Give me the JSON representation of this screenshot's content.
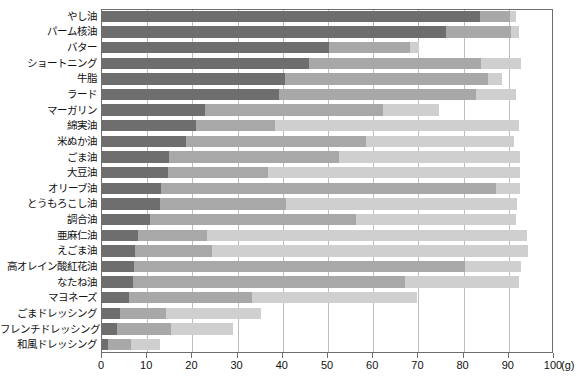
{
  "chart_data": {
    "type": "bar",
    "orientation": "horizontal",
    "stacked": true,
    "title": "",
    "subtitle": "",
    "xlabel": "",
    "ylabel": "",
    "unit_label": "(g)",
    "xlim": [
      0,
      100
    ],
    "xticks": [
      0,
      10,
      20,
      30,
      40,
      50,
      60,
      70,
      80,
      90,
      100
    ],
    "xticklabels": [
      "0",
      "10",
      "20",
      "30",
      "40",
      "50",
      "60",
      "70",
      "80",
      "90",
      "100"
    ],
    "grid": "vertical",
    "legend": "none",
    "categories": [
      "やし油",
      "パーム核油",
      "バター",
      "ショートニング",
      "牛脂",
      "ラード",
      "マーガリン",
      "綿実油",
      "米ぬか油",
      "ごま油",
      "大豆油",
      "オリーブ油",
      "とうもろこし油",
      "調合油",
      "亜麻仁油",
      "えごま油",
      "高オレイン酸紅花油",
      "なたね油",
      "マヨネーズ",
      "ごまドレッシング",
      "フレンチドレッシング",
      "和風ドレッシング"
    ],
    "series": [
      {
        "name": "segment-1",
        "color": "#6e6e6e",
        "values": [
          83.9,
          76.3,
          50.4,
          46.0,
          40.7,
          39.3,
          23.0,
          21.1,
          18.8,
          15.0,
          14.9,
          13.3,
          13.0,
          10.9,
          8.1,
          7.6,
          7.4,
          7.1,
          6.1,
          4.2,
          3.5,
          1.6
        ]
      },
      {
        "name": "segment-2",
        "color": "#a8a8a8",
        "values": [
          6.5,
          14.5,
          17.9,
          38.0,
          45.0,
          43.6,
          39.3,
          17.4,
          39.8,
          37.6,
          22.1,
          74.0,
          27.9,
          45.5,
          15.4,
          16.9,
          73.2,
          60.1,
          27.3,
          10.2,
          12.0,
          5.0
        ]
      },
      {
        "name": "segment-3",
        "color": "#cfcfcf",
        "values": [
          1.5,
          1.7,
          2.1,
          9.0,
          3.1,
          9.0,
          12.5,
          54.0,
          32.8,
          40.1,
          55.8,
          5.4,
          51.2,
          35.5,
          70.8,
          70.0,
          12.3,
          25.2,
          36.6,
          21.1,
          13.8,
          6.5
        ]
      }
    ],
    "series_totals": [
      91.9,
      92.5,
      70.4,
      93.0,
      88.8,
      91.9,
      74.8,
      92.5,
      91.4,
      92.7,
      92.8,
      92.7,
      92.1,
      91.9,
      94.3,
      94.5,
      92.9,
      92.4,
      70.0,
      35.5,
      29.3,
      13.1
    ]
  }
}
